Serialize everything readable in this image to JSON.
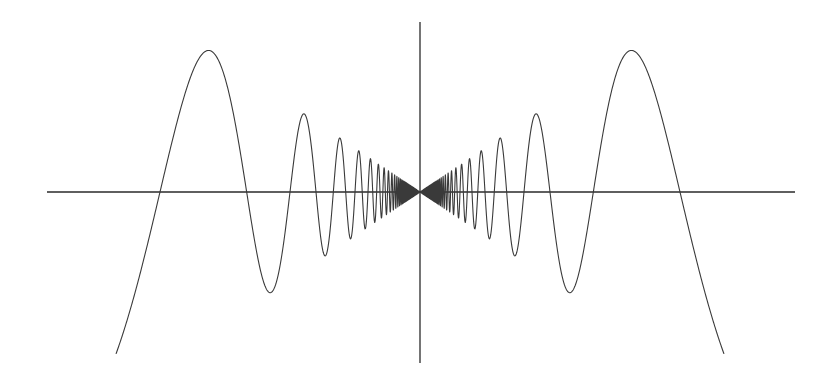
{
  "chart_data": {
    "type": "line",
    "title": "",
    "xlabel": "",
    "ylabel": "",
    "function": "y = x·sin(1/x)",
    "grid": false,
    "legend": null,
    "tick_labels": [],
    "axes": {
      "origin_px": [
        420,
        192
      ],
      "x_axis_px": {
        "from": 47,
        "to": 795,
        "y": 192
      },
      "y_axis_px": {
        "from": 22,
        "to": 363,
        "x": 420
      }
    },
    "curve_model": {
      "center_x_px": 420,
      "baseline_y_px": 192,
      "period_constant_px": 520,
      "amplitude_scale": 0.675,
      "max_distance_px": 304
    },
    "key_points_px": {
      "zero_crossings_left": [
        160,
        246,
        289
      ],
      "zero_crossings_right": [
        550,
        593,
        679
      ],
      "main_peaks": [
        [
          208,
          47
        ],
        [
          630,
          47
        ]
      ],
      "secondary_peaks": [
        [
          301,
          113
        ],
        [
          540,
          112
        ]
      ],
      "first_troughs": [
        [
          270,
          296
        ],
        [
          570,
          295
        ]
      ],
      "curve_ends": [
        [
          117,
          363
        ],
        [
          724,
          361
        ]
      ]
    },
    "series": [
      {
        "name": "x·sin(1/x)",
        "color": "#3a3a3a"
      }
    ],
    "axis_color": "#2a2a2a",
    "background": "#ffffff"
  }
}
